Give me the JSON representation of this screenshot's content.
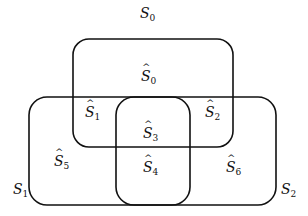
{
  "diagram": {
    "type": "venn-region-diagram",
    "outer_labels": [
      {
        "id": "S0",
        "base": "S",
        "sub": "0",
        "hat": false,
        "x": 142,
        "y": 12
      },
      {
        "id": "S1",
        "base": "S",
        "sub": "1",
        "hat": false,
        "x": 15,
        "y": 178
      },
      {
        "id": "S2",
        "base": "S",
        "sub": "2",
        "hat": false,
        "x": 283,
        "y": 178
      }
    ],
    "region_labels": [
      {
        "id": "S0hat",
        "base": "S",
        "sub": "0",
        "hat": true,
        "x": 143,
        "y": 67
      },
      {
        "id": "S1hat",
        "base": "S",
        "sub": "1",
        "hat": true,
        "x": 87,
        "y": 128
      },
      {
        "id": "S2hat",
        "base": "S",
        "sub": "2",
        "hat": true,
        "x": 206,
        "y": 128
      },
      {
        "id": "S3hat",
        "base": "S",
        "sub": "3",
        "hat": true,
        "x": 144,
        "y": 125
      },
      {
        "id": "S4hat",
        "base": "S",
        "sub": "4",
        "hat": true,
        "x": 144,
        "y": 163
      },
      {
        "id": "S5hat",
        "base": "S",
        "sub": "5",
        "hat": true,
        "x": 55,
        "y": 157
      },
      {
        "id": "S6hat",
        "base": "S",
        "sub": "6",
        "hat": true,
        "x": 227,
        "y": 163
      }
    ],
    "boxes": [
      {
        "name": "top-set-box",
        "x": 73,
        "y": 39,
        "w": 160,
        "h": 108,
        "r": 16
      },
      {
        "name": "bottom-union-box",
        "x": 29,
        "y": 97,
        "w": 247,
        "h": 108,
        "r": 18
      },
      {
        "name": "middle-set-box",
        "x": 116,
        "y": 97,
        "w": 74,
        "h": 108,
        "r": 18
      }
    ],
    "stroke_color": "#111111"
  }
}
